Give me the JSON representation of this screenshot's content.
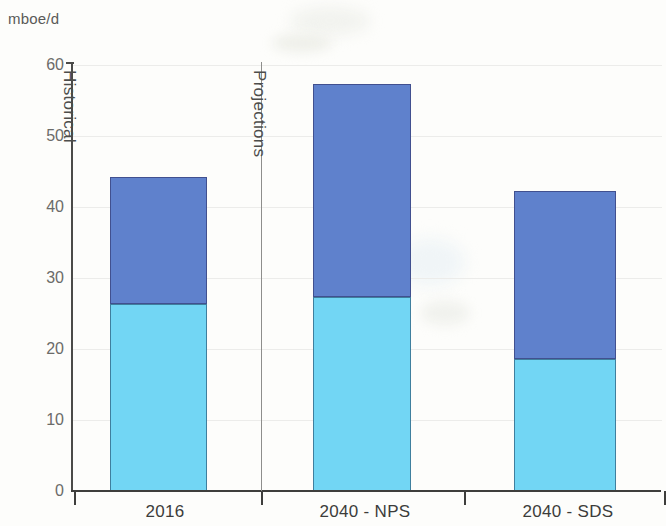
{
  "chart_data": {
    "type": "bar",
    "stacked": true,
    "title": "",
    "subtitle": "",
    "xlabel": "",
    "ylabel": "mboe/d",
    "unit_label": "mboe/d",
    "categories": [
      "2016",
      "2040 - NPS",
      "2040 - SDS"
    ],
    "series": [
      {
        "name": "lower-segment",
        "color": "#72D6F4",
        "values": [
          26.4,
          27.3,
          18.6
        ]
      },
      {
        "name": "upper-segment",
        "color": "#5F81CC",
        "values": [
          17.8,
          30.0,
          23.7
        ]
      }
    ],
    "totals": [
      44.2,
      57.3,
      42.3
    ],
    "ylim": [
      0,
      60
    ],
    "yticks": [
      0,
      10,
      20,
      30,
      40,
      50,
      60
    ],
    "ytick_labels": [
      "0",
      "10",
      "20",
      "30",
      "40",
      "50",
      "60"
    ],
    "grid": true,
    "legend": "none",
    "annotations": [
      {
        "text": "Historical",
        "orientation": "vertical",
        "region": "left-of-divider"
      },
      {
        "text": "Projections",
        "orientation": "vertical",
        "region": "right-of-divider"
      }
    ],
    "divider_after_category": "2016"
  },
  "axes": {
    "y_unit": "mboe/d",
    "y_ticks": [
      "60",
      "50",
      "40",
      "30",
      "20",
      "10",
      "0"
    ],
    "x_categories": [
      "2016",
      "2040 - NPS",
      "2040 - SDS"
    ]
  },
  "regions": {
    "historical": "Historical",
    "projections": "Projections"
  },
  "colors": {
    "upper_segment": "#5F81CC",
    "lower_segment": "#72D6F4",
    "axis": "#3e3e3c",
    "grid": "#ececea",
    "background": "#fdfdfb",
    "text": "#4d4d4b"
  }
}
